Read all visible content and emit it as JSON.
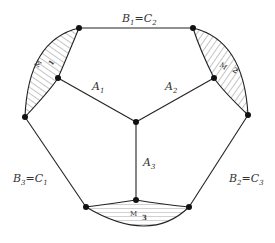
{
  "diagram": {
    "labels": {
      "top": {
        "main": "B",
        "sub1": "1",
        "eq": "=",
        "main2": "C",
        "sub2": "2"
      },
      "left": {
        "main": "B",
        "sub1": "3",
        "eq": "=",
        "main2": "C",
        "sub2": "1"
      },
      "right": {
        "main": "B",
        "sub1": "2",
        "eq": "=",
        "main2": "C",
        "sub2": "3"
      },
      "a1": {
        "main": "A",
        "sub": "1"
      },
      "a2": {
        "main": "A",
        "sub": "2"
      },
      "a3": {
        "main": "A",
        "sub": "3"
      }
    },
    "regions": [
      {
        "id": "M1",
        "letter": "M",
        "number": "1",
        "hatch": "diagonal"
      },
      {
        "id": "M2",
        "letter": "M",
        "number": "2",
        "hatch": "diagonal"
      },
      {
        "id": "M3",
        "letter": "M",
        "number": "3",
        "hatch": "horizontal"
      }
    ],
    "colors": {
      "stroke": "#222222",
      "node": "#111111",
      "hatch": "#555555"
    }
  }
}
